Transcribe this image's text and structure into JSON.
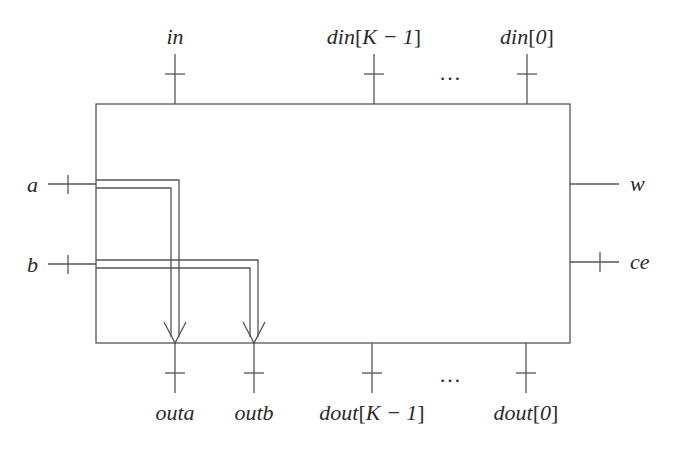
{
  "diagram": {
    "type": "block-diagram",
    "block": {
      "x": 96,
      "y": 104,
      "width": 474,
      "height": 239
    },
    "top_inputs": [
      {
        "id": "in",
        "label": "in",
        "x": 175
      },
      {
        "id": "din_k1",
        "label_base": "din",
        "index": "K − 1",
        "x": 374
      },
      {
        "id": "din_0",
        "label_base": "din",
        "index": "0",
        "x": 527
      }
    ],
    "top_ellipsis": "…",
    "left_inputs": [
      {
        "id": "a",
        "label": "a",
        "y": 184
      },
      {
        "id": "b",
        "label": "b",
        "y": 264
      }
    ],
    "right_ports": [
      {
        "id": "w",
        "label": "w",
        "y": 184,
        "ticked": false
      },
      {
        "id": "ce",
        "label": "ce",
        "y": 262,
        "ticked": true
      }
    ],
    "bottom_outputs": [
      {
        "id": "outa",
        "label": "outa",
        "x": 175
      },
      {
        "id": "outb",
        "label": "outb",
        "x": 254
      },
      {
        "id": "dout_k1",
        "label_base": "dout",
        "index": "K − 1",
        "x": 372
      },
      {
        "id": "dout_0",
        "label_base": "dout",
        "index": "0",
        "x": 526
      }
    ],
    "bottom_ellipsis": "…",
    "internal_paths": [
      {
        "from": "a",
        "to": "outa"
      },
      {
        "from": "b",
        "to": "outb"
      }
    ]
  }
}
